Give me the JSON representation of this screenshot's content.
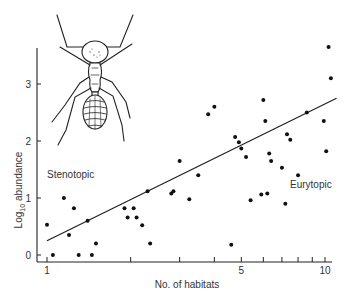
{
  "chart_data": {
    "type": "scatter",
    "title": "",
    "xlabel": "No. of habitats",
    "ylabel": "Log10 abundance",
    "ylabel_main": "Log",
    "ylabel_sub": "10",
    "ylabel_rest": " abundance",
    "xscale": "log",
    "xlim": [
      0.95,
      11
    ],
    "ylim": [
      -0.1,
      3.8
    ],
    "x_tick_positions": [
      1,
      2,
      3,
      4,
      5,
      6,
      7,
      8,
      9,
      10
    ],
    "x_tick_labels": [
      {
        "value": 1,
        "label": "1"
      },
      {
        "value": 5,
        "label": "5"
      },
      {
        "value": 10,
        "label": "10"
      }
    ],
    "y_ticks": [
      {
        "value": 0,
        "label": "0"
      },
      {
        "value": 1,
        "label": "1"
      },
      {
        "value": 2,
        "label": "2"
      },
      {
        "value": 3,
        "label": "3"
      }
    ],
    "grid": false,
    "legend": null,
    "annotations": [
      {
        "text": "Stenotopic",
        "x": 1.05,
        "y": 1.5
      },
      {
        "text": "Eurytopic",
        "x": 8.5,
        "y": 1.4
      }
    ],
    "regression_line": {
      "x": [
        1,
        11
      ],
      "y": [
        0.25,
        2.75
      ]
    },
    "points": [
      {
        "x": 1.0,
        "y": 0.53
      },
      {
        "x": 1.05,
        "y": 0.0
      },
      {
        "x": 1.15,
        "y": 1.0
      },
      {
        "x": 1.2,
        "y": 0.35
      },
      {
        "x": 1.25,
        "y": 0.82
      },
      {
        "x": 1.3,
        "y": 0.0
      },
      {
        "x": 1.4,
        "y": 0.6
      },
      {
        "x": 1.45,
        "y": 0.0
      },
      {
        "x": 1.5,
        "y": 0.2
      },
      {
        "x": 1.9,
        "y": 0.82
      },
      {
        "x": 1.95,
        "y": 0.66
      },
      {
        "x": 2.05,
        "y": 0.82
      },
      {
        "x": 2.1,
        "y": 0.66
      },
      {
        "x": 2.2,
        "y": 0.52
      },
      {
        "x": 2.3,
        "y": 1.12
      },
      {
        "x": 2.35,
        "y": 0.2
      },
      {
        "x": 2.8,
        "y": 1.08
      },
      {
        "x": 2.85,
        "y": 1.12
      },
      {
        "x": 3.0,
        "y": 1.65
      },
      {
        "x": 3.25,
        "y": 0.98
      },
      {
        "x": 3.5,
        "y": 1.4
      },
      {
        "x": 3.8,
        "y": 2.47
      },
      {
        "x": 4.0,
        "y": 2.6
      },
      {
        "x": 4.6,
        "y": 0.18
      },
      {
        "x": 4.75,
        "y": 2.07
      },
      {
        "x": 4.9,
        "y": 1.98
      },
      {
        "x": 5.0,
        "y": 1.87
      },
      {
        "x": 5.2,
        "y": 1.72
      },
      {
        "x": 5.4,
        "y": 0.96
      },
      {
        "x": 5.9,
        "y": 1.06
      },
      {
        "x": 6.0,
        "y": 2.72
      },
      {
        "x": 6.1,
        "y": 2.35
      },
      {
        "x": 6.2,
        "y": 1.08
      },
      {
        "x": 6.3,
        "y": 1.78
      },
      {
        "x": 6.4,
        "y": 1.65
      },
      {
        "x": 7.0,
        "y": 1.53
      },
      {
        "x": 7.2,
        "y": 0.9
      },
      {
        "x": 7.3,
        "y": 2.12
      },
      {
        "x": 7.5,
        "y": 2.02
      },
      {
        "x": 8.0,
        "y": 1.4
      },
      {
        "x": 8.6,
        "y": 2.5
      },
      {
        "x": 9.9,
        "y": 2.35
      },
      {
        "x": 10.1,
        "y": 1.82
      },
      {
        "x": 10.3,
        "y": 3.65
      },
      {
        "x": 10.5,
        "y": 3.1
      }
    ]
  },
  "illustration": {
    "subject": "ant-drawing"
  }
}
